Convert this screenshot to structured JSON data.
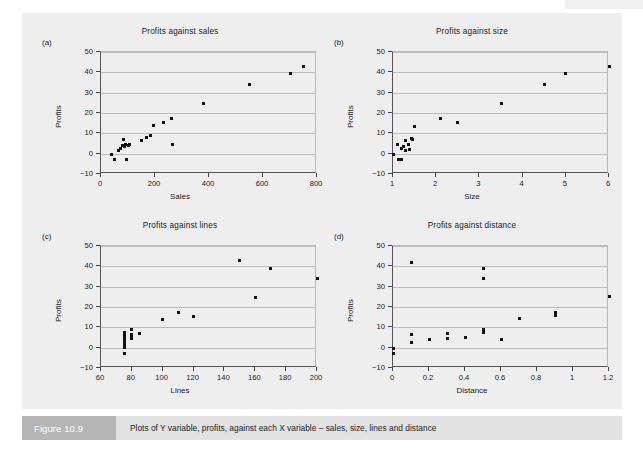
{
  "figure": {
    "caption_tag": "Figure 10.9",
    "caption_text": "Plots of Y variable, profits, against each X variable – sales, size, lines and distance",
    "colors": {
      "panel_background": "#eeeeee",
      "gridline": "#bcbcbc",
      "axis": "#555555",
      "marker": "#111111",
      "caption_tag_background": "#b6b6b6",
      "caption_bar_background": "#e2e2e2"
    }
  },
  "chart_data": [
    {
      "id": "a",
      "panel_letter": "(a)",
      "type": "scatter",
      "title": "Profits against sales",
      "xlabel": "Sales",
      "ylabel": "Profits",
      "xlim": [
        0,
        800
      ],
      "ylim": [
        -10,
        50
      ],
      "xticks": [
        0,
        200,
        400,
        600,
        800
      ],
      "xtick_labels": [
        "0",
        "200",
        "400",
        "600",
        "800"
      ],
      "yticks": [
        -10,
        0,
        10,
        20,
        30,
        40,
        50
      ],
      "ytick_labels": [
        "−10",
        "0",
        "10",
        "20",
        "30",
        "40",
        "50"
      ],
      "grid": true,
      "points": [
        {
          "x": 40,
          "y": -0.5
        },
        {
          "x": 50,
          "y": -3
        },
        {
          "x": 65,
          "y": 1.5
        },
        {
          "x": 72,
          "y": 2.5
        },
        {
          "x": 80,
          "y": 4
        },
        {
          "x": 85,
          "y": 7
        },
        {
          "x": 88,
          "y": 3.5
        },
        {
          "x": 92,
          "y": 4.5
        },
        {
          "x": 95,
          "y": -3
        },
        {
          "x": 100,
          "y": 4
        },
        {
          "x": 105,
          "y": 4.5
        },
        {
          "x": 150,
          "y": 6.5
        },
        {
          "x": 170,
          "y": 8
        },
        {
          "x": 185,
          "y": 9
        },
        {
          "x": 195,
          "y": 14
        },
        {
          "x": 230,
          "y": 15.5
        },
        {
          "x": 262,
          "y": 17.5
        },
        {
          "x": 265,
          "y": 4.5
        },
        {
          "x": 380,
          "y": 24.5
        },
        {
          "x": 550,
          "y": 34
        },
        {
          "x": 700,
          "y": 39.5
        },
        {
          "x": 750,
          "y": 43
        }
      ]
    },
    {
      "id": "b",
      "panel_letter": "(b)",
      "type": "scatter",
      "title": "Profits against size",
      "xlabel": "Size",
      "ylabel": "Profits",
      "xlim": [
        1,
        6
      ],
      "ylim": [
        -10,
        50
      ],
      "xticks": [
        1,
        2,
        3,
        4,
        5,
        6
      ],
      "xtick_labels": [
        "1",
        "2",
        "3",
        "4",
        "5",
        "6"
      ],
      "yticks": [
        -10,
        0,
        10,
        20,
        30,
        40,
        50
      ],
      "ytick_labels": [
        "−10",
        "0",
        "10",
        "20",
        "30",
        "40",
        "50"
      ],
      "grid": true,
      "points": [
        {
          "x": 1.0,
          "y": -0.5
        },
        {
          "x": 1.1,
          "y": 4.5
        },
        {
          "x": 1.12,
          "y": -3
        },
        {
          "x": 1.2,
          "y": -3
        },
        {
          "x": 1.2,
          "y": 2.5
        },
        {
          "x": 1.25,
          "y": 3.5
        },
        {
          "x": 1.28,
          "y": 1.5
        },
        {
          "x": 1.3,
          "y": 6.5
        },
        {
          "x": 1.35,
          "y": 4.5
        },
        {
          "x": 1.38,
          "y": 2
        },
        {
          "x": 1.42,
          "y": 7.5
        },
        {
          "x": 1.45,
          "y": 7
        },
        {
          "x": 1.5,
          "y": 13.5
        },
        {
          "x": 2.1,
          "y": 17.5
        },
        {
          "x": 2.5,
          "y": 15.5
        },
        {
          "x": 3.5,
          "y": 24.5
        },
        {
          "x": 4.5,
          "y": 34
        },
        {
          "x": 5.0,
          "y": 39.5
        },
        {
          "x": 6.0,
          "y": 43
        }
      ]
    },
    {
      "id": "c",
      "panel_letter": "(c)",
      "type": "scatter",
      "title": "Profits against lines",
      "xlabel": "Lines",
      "ylabel": "Profits",
      "xlim": [
        60,
        200
      ],
      "ylim": [
        -10,
        50
      ],
      "xticks": [
        60,
        80,
        100,
        120,
        140,
        160,
        180,
        200
      ],
      "xtick_labels": [
        "60",
        "80",
        "100",
        "120",
        "140",
        "160",
        "180",
        "200"
      ],
      "yticks": [
        -10,
        0,
        10,
        20,
        30,
        40,
        50
      ],
      "ytick_labels": [
        "−10",
        "0",
        "10",
        "20",
        "30",
        "40",
        "50"
      ],
      "grid": true,
      "points": [
        {
          "x": 75,
          "y": 7.5
        },
        {
          "x": 75,
          "y": 6
        },
        {
          "x": 75,
          "y": 4.5
        },
        {
          "x": 75,
          "y": 3
        },
        {
          "x": 75,
          "y": 1.5
        },
        {
          "x": 75,
          "y": 0
        },
        {
          "x": 75,
          "y": -3
        },
        {
          "x": 80,
          "y": 9
        },
        {
          "x": 80,
          "y": 6.5
        },
        {
          "x": 80,
          "y": 5
        },
        {
          "x": 80,
          "y": 4.5
        },
        {
          "x": 85,
          "y": 7
        },
        {
          "x": 100,
          "y": 14
        },
        {
          "x": 110,
          "y": 17.5
        },
        {
          "x": 120,
          "y": 15.5
        },
        {
          "x": 150,
          "y": 43
        },
        {
          "x": 160,
          "y": 24.5
        },
        {
          "x": 170,
          "y": 39
        },
        {
          "x": 200,
          "y": 34
        }
      ]
    },
    {
      "id": "d",
      "panel_letter": "(d)",
      "type": "scatter",
      "title": "Profits against distance",
      "xlabel": "Distance",
      "ylabel": "Profits",
      "xlim": [
        0,
        1.2
      ],
      "ylim": [
        -10,
        50
      ],
      "xticks": [
        0,
        0.2,
        0.4,
        0.6,
        0.8,
        1,
        1.2
      ],
      "xtick_labels": [
        "0",
        "0.2",
        "0.4",
        "0.6",
        "0.8",
        "1",
        "1.2"
      ],
      "yticks": [
        -10,
        0,
        10,
        20,
        30,
        40,
        50
      ],
      "ytick_labels": [
        "−10",
        "0",
        "10",
        "20",
        "30",
        "40",
        "50"
      ],
      "grid": true,
      "points": [
        {
          "x": 0.0,
          "y": -0.5
        },
        {
          "x": 0.0,
          "y": -3
        },
        {
          "x": 0.1,
          "y": 42
        },
        {
          "x": 0.1,
          "y": 6.5
        },
        {
          "x": 0.1,
          "y": 2.5
        },
        {
          "x": 0.2,
          "y": 4
        },
        {
          "x": 0.3,
          "y": 7
        },
        {
          "x": 0.3,
          "y": 4.5
        },
        {
          "x": 0.4,
          "y": 5
        },
        {
          "x": 0.5,
          "y": 39
        },
        {
          "x": 0.5,
          "y": 34
        },
        {
          "x": 0.5,
          "y": 9
        },
        {
          "x": 0.5,
          "y": 7.5
        },
        {
          "x": 0.6,
          "y": 4
        },
        {
          "x": 0.7,
          "y": 14.5
        },
        {
          "x": 0.9,
          "y": 17.5
        },
        {
          "x": 0.9,
          "y": 16
        },
        {
          "x": 1.2,
          "y": 25
        }
      ]
    }
  ]
}
